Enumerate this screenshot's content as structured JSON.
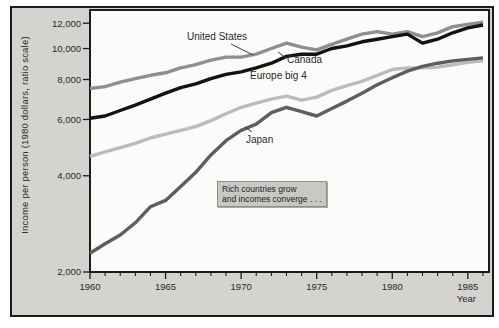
{
  "figure": {
    "outer_bg": "#ffffff",
    "frame_bg": "#d5d3d0",
    "frame_border": "#1b1b1b",
    "plot_bg": "#fbfbfa",
    "axis_color": "#1b1b1b",
    "text_color": "#2a2a2a",
    "y_axis_title": "Income per person (1980 dollars, ratio scale)",
    "x_axis_title": "Year",
    "annotation": {
      "line1": "Rich countries grow",
      "line2": "and incomes converge . . ."
    }
  },
  "chart_data": {
    "type": "line",
    "title": "",
    "xlabel": "Year",
    "ylabel": "Income per person (1980 dollars, ratio scale)",
    "y_scale": "log",
    "grid": false,
    "xlim": [
      1960,
      1986.4
    ],
    "ylim": [
      2000,
      13200
    ],
    "x_major_ticks": [
      {
        "value": 1960,
        "label": "1960"
      },
      {
        "value": 1965,
        "label": "1965"
      },
      {
        "value": 1970,
        "label": "1970"
      },
      {
        "value": 1975,
        "label": "1975"
      },
      {
        "value": 1980,
        "label": "1980"
      },
      {
        "value": 1985,
        "label": "1985"
      }
    ],
    "x_minor_tick_step": 1,
    "y_ticks": [
      {
        "value": 2000,
        "label": "2,000"
      },
      {
        "value": 4000,
        "label": "4,000"
      },
      {
        "value": 6000,
        "label": "6,000"
      },
      {
        "value": 8000,
        "label": "8,000"
      },
      {
        "value": 10000,
        "label": "10,000"
      },
      {
        "value": 12000,
        "label": "12,000"
      }
    ],
    "years": [
      1960,
      1961,
      1962,
      1963,
      1964,
      1965,
      1966,
      1967,
      1968,
      1969,
      1970,
      1971,
      1972,
      1973,
      1974,
      1975,
      1976,
      1977,
      1978,
      1979,
      1980,
      1981,
      1982,
      1983,
      1984,
      1985,
      1986
    ],
    "series": [
      {
        "name": "Europe big 4",
        "slug": "europe-big-4",
        "color": "#bcbcbc",
        "label_pos": [
          250,
          70
        ],
        "values": [
          4600,
          4750,
          4900,
          5050,
          5250,
          5400,
          5550,
          5700,
          5950,
          6250,
          6550,
          6750,
          6950,
          7100,
          6900,
          7050,
          7400,
          7650,
          7900,
          8250,
          8600,
          8700,
          8700,
          8750,
          8900,
          9050,
          9150
        ]
      },
      {
        "name": "United States",
        "slug": "united-states",
        "color": "#8f8f8f",
        "label_pos": [
          187,
          31
        ],
        "leader": [
          [
            231,
            44
          ],
          [
            253,
            55
          ]
        ],
        "values": [
          7500,
          7600,
          7850,
          8050,
          8250,
          8400,
          8700,
          8900,
          9200,
          9400,
          9400,
          9600,
          10000,
          10400,
          10100,
          9900,
          10300,
          10700,
          11100,
          11300,
          11100,
          11300,
          10900,
          11200,
          11700,
          11900,
          12100
        ]
      },
      {
        "name": "Japan",
        "slug": "japan",
        "color": "#5e5e5e",
        "label_pos": [
          246,
          134
        ],
        "leader": [
          [
            245,
            127
          ],
          [
            252,
            132
          ]
        ],
        "values": [
          2290,
          2450,
          2610,
          2850,
          3200,
          3350,
          3700,
          4100,
          4650,
          5150,
          5550,
          5800,
          6300,
          6550,
          6350,
          6150,
          6500,
          6850,
          7250,
          7700,
          8100,
          8500,
          8800,
          9000,
          9150,
          9250,
          9350
        ]
      },
      {
        "name": "Canada",
        "slug": "canada",
        "color": "#121212",
        "label_pos": [
          287,
          54
        ],
        "leader": [
          [
            278,
            52
          ],
          [
            286,
            58
          ]
        ],
        "values": [
          6050,
          6150,
          6400,
          6650,
          6950,
          7250,
          7550,
          7750,
          8050,
          8300,
          8450,
          8700,
          9000,
          9450,
          9600,
          9600,
          10000,
          10200,
          10500,
          10700,
          10900,
          11100,
          10400,
          10700,
          11200,
          11600,
          11850
        ]
      }
    ]
  }
}
